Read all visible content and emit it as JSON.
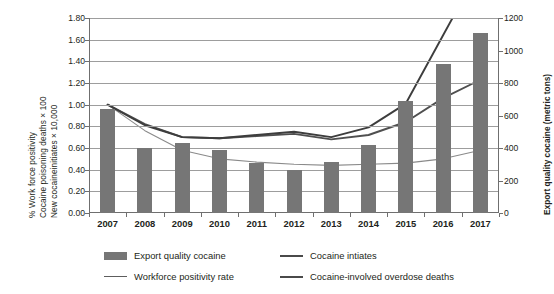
{
  "chart_data": {
    "type": "bar",
    "title": "",
    "categories": [
      "2007",
      "2008",
      "2009",
      "2010",
      "2011",
      "2012",
      "2013",
      "2014",
      "2015",
      "2016",
      "2017"
    ],
    "xlabel": "",
    "ylabel": "% Work force positivity  Cocaine poisoning deaths × 100  New cocaine initiates × 10,000",
    "ylim": [
      0,
      1.8
    ],
    "y_ticks": [
      "0.00",
      "0.20",
      "0.40",
      "0.60",
      "0.80",
      "1.00",
      "1.20",
      "1.40",
      "1.60",
      "1.80"
    ],
    "y2label": "Export quality cocaine (metric tons)",
    "y2lim": [
      0,
      1200
    ],
    "y2_ticks": [
      "0",
      "200",
      "400",
      "600",
      "800",
      "1000",
      "1200"
    ],
    "grid": true,
    "legend_position": "bottom",
    "series": [
      {
        "name": "Export quality cocaine",
        "type": "bar",
        "axis": "right",
        "unit": "metric tons",
        "values": [
          640,
          400,
          430,
          385,
          305,
          265,
          315,
          420,
          690,
          920,
          1110
        ]
      },
      {
        "name": "Cocaine intiates",
        "type": "line",
        "axis": "left",
        "unit": "New cocaine initiates × 10,000",
        "values": [
          1.0,
          0.82,
          0.7,
          0.69,
          0.71,
          0.73,
          0.68,
          0.72,
          0.84,
          1.06,
          1.23
        ]
      },
      {
        "name": "Workforce positivity rate",
        "type": "line",
        "axis": "left",
        "unit": "% Work force positivity",
        "values": [
          1.0,
          0.76,
          0.58,
          0.5,
          0.47,
          0.45,
          0.44,
          0.45,
          0.46,
          0.5,
          0.58
        ]
      },
      {
        "name": "Cocaine-involved overdose deaths",
        "type": "line",
        "axis": "left",
        "unit": "Cocaine poisoning deaths × 100",
        "values": [
          1.0,
          0.81,
          0.7,
          0.69,
          0.72,
          0.75,
          0.7,
          0.79,
          1.01,
          1.64,
          null
        ],
        "note": "line is clipped at top of plot after 2016"
      }
    ],
    "left_axis_title_lines": [
      "% Work force positivity",
      "Cocaine poisoning  deaths × 100",
      "New cocaineinitiates × 10,000"
    ],
    "right_axis_title": "Export quality cocaine (metric tons)"
  },
  "legend": {
    "items": [
      {
        "label": "Export quality cocaine",
        "marker": "bar"
      },
      {
        "label": "Cocaine intiates",
        "marker": "line"
      },
      {
        "label": "Workforce positivity rate",
        "marker": "line"
      },
      {
        "label": "Cocaine-involved overdose deaths",
        "marker": "line"
      }
    ]
  }
}
